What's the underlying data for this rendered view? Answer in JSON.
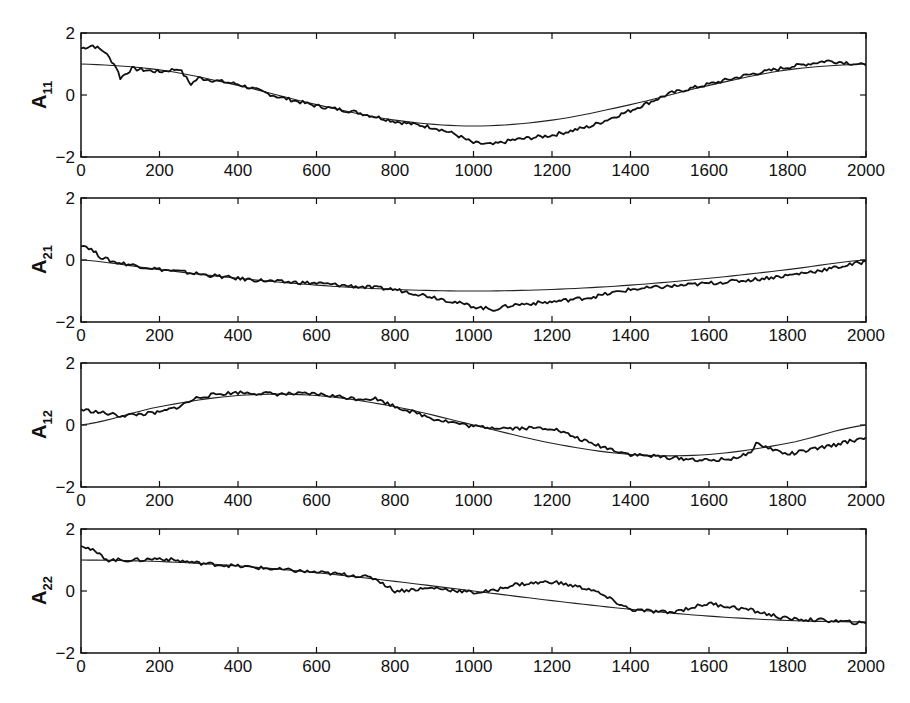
{
  "chart_data": [
    {
      "type": "line",
      "ylabel": "A",
      "ylabel_sub": "11",
      "xlim": [
        0,
        2000
      ],
      "ylim": [
        -2,
        2
      ],
      "xticks": [
        0,
        200,
        400,
        600,
        800,
        1000,
        1200,
        1400,
        1600,
        1800,
        2000
      ],
      "yticks": [
        -2,
        0,
        2
      ],
      "series": [
        {
          "name": "true",
          "x": [
            0,
            200,
            400,
            600,
            800,
            1000,
            1200,
            1400,
            1600,
            1800,
            2000
          ],
          "values": [
            1.0,
            0.81,
            0.31,
            -0.31,
            -0.81,
            -1.0,
            -0.81,
            -0.31,
            0.31,
            0.81,
            1.0
          ]
        },
        {
          "name": "estimate",
          "x": [
            0,
            30,
            60,
            90,
            100,
            130,
            200,
            250,
            280,
            300,
            400,
            500,
            600,
            700,
            800,
            900,
            950,
            1000,
            1050,
            1100,
            1200,
            1300,
            1400,
            1500,
            1600,
            1700,
            1800,
            1900,
            1950,
            2000
          ],
          "values": [
            1.5,
            1.6,
            1.4,
            0.9,
            0.55,
            0.85,
            0.75,
            0.85,
            0.35,
            0.55,
            0.35,
            -0.05,
            -0.35,
            -0.55,
            -0.85,
            -1.05,
            -1.25,
            -1.55,
            -1.6,
            -1.45,
            -1.3,
            -1.0,
            -0.5,
            0.05,
            0.35,
            0.65,
            0.9,
            1.1,
            1.05,
            0.95
          ]
        }
      ]
    },
    {
      "type": "line",
      "ylabel": "A",
      "ylabel_sub": "21",
      "xlim": [
        0,
        2000
      ],
      "ylim": [
        -2,
        2
      ],
      "xticks": [
        0,
        200,
        400,
        600,
        800,
        1000,
        1200,
        1400,
        1600,
        1800,
        2000
      ],
      "yticks": [
        -2,
        0,
        2
      ],
      "series": [
        {
          "name": "true",
          "x": [
            0,
            200,
            400,
            600,
            800,
            1000,
            1200,
            1400,
            1600,
            1800,
            2000
          ],
          "values": [
            0.0,
            -0.31,
            -0.59,
            -0.81,
            -0.95,
            -1.0,
            -0.95,
            -0.81,
            -0.59,
            -0.31,
            0.0
          ]
        },
        {
          "name": "estimate",
          "x": [
            0,
            20,
            50,
            80,
            150,
            200,
            300,
            400,
            500,
            600,
            700,
            800,
            900,
            1000,
            1050,
            1100,
            1200,
            1300,
            1400,
            1500,
            1600,
            1700,
            1800,
            1900,
            2000
          ],
          "values": [
            0.5,
            0.4,
            0.1,
            -0.05,
            -0.2,
            -0.3,
            -0.45,
            -0.6,
            -0.7,
            -0.75,
            -0.85,
            -0.95,
            -1.2,
            -1.5,
            -1.6,
            -1.45,
            -1.35,
            -1.2,
            -0.95,
            -0.85,
            -0.75,
            -0.65,
            -0.5,
            -0.3,
            -0.05
          ]
        }
      ]
    },
    {
      "type": "line",
      "ylabel": "A",
      "ylabel_sub": "12",
      "xlim": [
        0,
        2000
      ],
      "ylim": [
        -2,
        2
      ],
      "xticks": [
        0,
        200,
        400,
        600,
        800,
        1000,
        1200,
        1400,
        1600,
        1800,
        2000
      ],
      "yticks": [
        -2,
        0,
        2
      ],
      "series": [
        {
          "name": "true",
          "x": [
            0,
            200,
            400,
            600,
            800,
            1000,
            1200,
            1400,
            1600,
            1800,
            2000
          ],
          "values": [
            0.0,
            0.59,
            0.95,
            0.95,
            0.59,
            0.0,
            -0.59,
            -0.95,
            -0.95,
            -0.59,
            0.0
          ]
        },
        {
          "name": "estimate",
          "x": [
            0,
            50,
            100,
            200,
            250,
            300,
            350,
            400,
            500,
            600,
            700,
            750,
            800,
            850,
            900,
            1000,
            1100,
            1200,
            1300,
            1400,
            1500,
            1600,
            1650,
            1700,
            1720,
            1800,
            1900,
            2000
          ],
          "values": [
            0.5,
            0.4,
            0.3,
            0.4,
            0.6,
            0.9,
            1.0,
            1.05,
            1.0,
            1.0,
            0.85,
            0.85,
            0.6,
            0.4,
            0.2,
            -0.05,
            -0.1,
            -0.1,
            -0.6,
            -0.95,
            -1.05,
            -1.15,
            -1.1,
            -0.95,
            -0.6,
            -0.95,
            -0.7,
            -0.4
          ]
        }
      ]
    },
    {
      "type": "line",
      "ylabel": "A",
      "ylabel_sub": "22",
      "xlim": [
        0,
        2000
      ],
      "ylim": [
        -2,
        2
      ],
      "xticks": [
        0,
        200,
        400,
        600,
        800,
        1000,
        1200,
        1400,
        1600,
        1800,
        2000
      ],
      "yticks": [
        -2,
        0,
        2
      ],
      "series": [
        {
          "name": "true",
          "x": [
            0,
            200,
            400,
            600,
            800,
            1000,
            1200,
            1400,
            1600,
            1800,
            2000
          ],
          "values": [
            1.0,
            0.95,
            0.81,
            0.59,
            0.31,
            0.0,
            -0.31,
            -0.59,
            -0.81,
            -0.95,
            -1.0
          ]
        },
        {
          "name": "estimate",
          "x": [
            0,
            30,
            70,
            150,
            200,
            300,
            400,
            500,
            600,
            700,
            750,
            800,
            900,
            1000,
            1050,
            1100,
            1200,
            1300,
            1400,
            1500,
            1600,
            1700,
            1800,
            1900,
            2000
          ],
          "values": [
            1.5,
            1.3,
            1.0,
            1.0,
            1.05,
            0.9,
            0.8,
            0.7,
            0.6,
            0.5,
            0.4,
            0.0,
            0.1,
            -0.05,
            0.0,
            0.2,
            0.3,
            0.05,
            -0.6,
            -0.7,
            -0.4,
            -0.6,
            -0.9,
            -0.95,
            -1.05
          ]
        }
      ]
    }
  ],
  "panels": [
    {
      "label": "A",
      "sub": "11"
    },
    {
      "label": "A",
      "sub": "21"
    },
    {
      "label": "A",
      "sub": "12"
    },
    {
      "label": "A",
      "sub": "22"
    }
  ],
  "xtick_labels": [
    "0",
    "200",
    "400",
    "600",
    "800",
    "1000",
    "1200",
    "1400",
    "1600",
    "1800",
    "2000"
  ],
  "ytick_labels": [
    "2",
    "0",
    "−2"
  ]
}
